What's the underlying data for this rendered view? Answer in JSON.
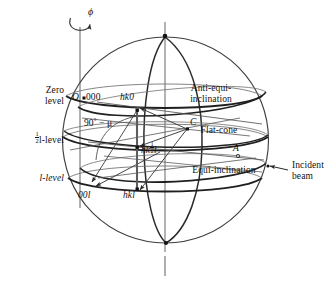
{
  "figure": {
    "type": "crystallography-sphere-of-reflection-diagram",
    "rotation_axis_symbol": "ϕ",
    "levels": [
      {
        "id": "zero",
        "label_line1": "Zero",
        "label_line2": "level",
        "reciprocal_index": "000"
      },
      {
        "id": "half-l",
        "label_num": "1",
        "label_den": "2",
        "label_tail": "l-level"
      },
      {
        "id": "l",
        "label_tail": "l-level"
      }
    ],
    "cone_labels": [
      {
        "id": "anti-equi-inclination",
        "line1": "Anti-equi-",
        "line2": "inclination"
      },
      {
        "id": "flat-cone",
        "line1": "Flat-cone",
        "line2": ""
      },
      {
        "id": "equi-inclination",
        "line1": "Equi-inclination",
        "line2": ""
      }
    ],
    "points": [
      {
        "id": "origin",
        "label": "O"
      },
      {
        "id": "origin-index",
        "label": "000"
      },
      {
        "id": "hk0",
        "label": "hk0"
      },
      {
        "id": "centre",
        "label": "C"
      },
      {
        "id": "hk-half-l",
        "label_pre": "hk",
        "label_num": "1",
        "label_den": "2",
        "label_post": "l"
      },
      {
        "id": "00l",
        "label": "00l"
      },
      {
        "id": "hkl",
        "label": "hkl"
      },
      {
        "id": "point-a",
        "label": "A"
      }
    ],
    "angle_annotation": {
      "value": "90",
      "degree": "°",
      "operator": "−",
      "symbol": "μ"
    },
    "incident_beam": {
      "line1": "Incident",
      "line2": "beam"
    },
    "colors": {
      "ink": "#1a1a1a",
      "sphere_outline": "#3a3a3a",
      "circle_heavy": "#2a2a2a",
      "circle_light": "#6b6b6b",
      "axis": "#8a8a8a",
      "vector": "#4a4a4a"
    }
  }
}
